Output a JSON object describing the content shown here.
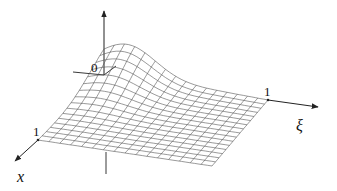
{
  "figure": {
    "type": "3d-surface-plot",
    "axes": {
      "vertical": {
        "label": "",
        "arrow": true
      },
      "xi": {
        "label": "ξ",
        "tick_label": "1"
      },
      "x": {
        "label": "x",
        "tick_label": "1"
      },
      "origin_label": "0"
    },
    "colors": {
      "axis": "#222222",
      "mesh": "#555555",
      "background": "#ffffff"
    },
    "mesh": {
      "divisions": 16
    }
  }
}
